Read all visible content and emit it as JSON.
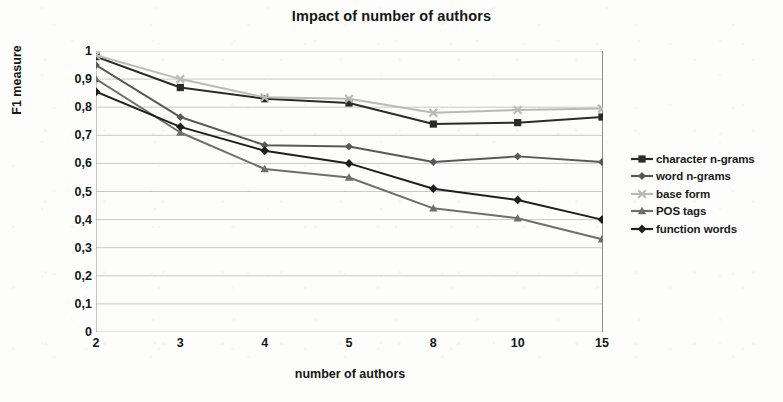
{
  "chart_data": {
    "type": "line",
    "title": "Impact of number of authors",
    "xlabel": "number of authors",
    "ylabel": "F1 measure",
    "categories": [
      "2",
      "3",
      "4",
      "5",
      "8",
      "10",
      "15"
    ],
    "ylim": [
      0,
      1
    ],
    "y_ticks": [
      "0",
      "0,1",
      "0,2",
      "0,3",
      "0,4",
      "0,5",
      "0,6",
      "0,7",
      "0,8",
      "0,9",
      "1"
    ],
    "y_tick_values": [
      0,
      0.1,
      0.2,
      0.3,
      0.4,
      0.5,
      0.6,
      0.7,
      0.8,
      0.9,
      1
    ],
    "grid": true,
    "legend_position": "right",
    "series": [
      {
        "name": "character n-grams",
        "marker": "square",
        "color": "#2b2b2b",
        "values": [
          0.98,
          0.87,
          0.83,
          0.815,
          0.74,
          0.745,
          0.765
        ]
      },
      {
        "name": "word n-grams",
        "marker": "diamond",
        "color": "#585858",
        "values": [
          0.95,
          0.765,
          0.665,
          0.66,
          0.605,
          0.625,
          0.605
        ]
      },
      {
        "name": "base form",
        "marker": "cross",
        "color": "#b9b9b9",
        "values": [
          0.985,
          0.9,
          0.835,
          0.83,
          0.78,
          0.79,
          0.795
        ]
      },
      {
        "name": "POS tags",
        "marker": "triangle",
        "color": "#6e6e6e",
        "values": [
          0.9,
          0.71,
          0.58,
          0.55,
          0.44,
          0.405,
          0.33
        ]
      },
      {
        "name": "function words",
        "marker": "diamond-filled",
        "color": "#1f1f1f",
        "values": [
          0.855,
          0.73,
          0.645,
          0.6,
          0.51,
          0.47,
          0.4
        ]
      }
    ]
  },
  "axis": {
    "grid_color": "#c9c9c9",
    "axis_color": "#8f8f8f"
  }
}
